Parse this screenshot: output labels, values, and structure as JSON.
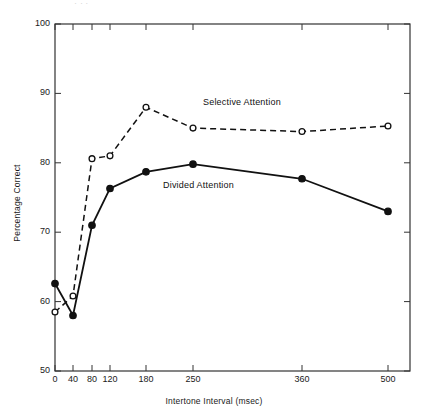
{
  "figure": {
    "top_fragment": "', ,',",
    "background_color": "#ffffff",
    "line_color": "#111111"
  },
  "chart_data": {
    "type": "line",
    "title": "",
    "xlabel": "Intertone Interval (msec)",
    "ylabel": "Percentage Correct",
    "categories": [
      "0",
      "40",
      "80",
      "120",
      "180",
      "250",
      "360",
      "500"
    ],
    "x": [
      0,
      40,
      80,
      120,
      180,
      250,
      360,
      500
    ],
    "xtick_labels": [
      "0",
      "40",
      "80",
      "120",
      "180",
      "250",
      "360",
      "500"
    ],
    "ytick_labels": [
      "50",
      "60",
      "70",
      "80",
      "90",
      "100"
    ],
    "yticks": [
      50,
      60,
      70,
      80,
      90,
      100
    ],
    "ylim": [
      50,
      100
    ],
    "x_scale": "ordinal",
    "grid": false,
    "legend": "inline-annotation",
    "series": [
      {
        "name": "Selective Attention",
        "values": [
          58.5,
          60.8,
          80.6,
          81.0,
          88.0,
          85.0,
          84.5,
          85.3
        ],
        "marker": "open-circle",
        "line_style": "dashed",
        "color": "#111111",
        "label_position": {
          "x": 203,
          "y": 97
        }
      },
      {
        "name": "Divided Attention",
        "values": [
          62.6,
          58.0,
          71.0,
          76.3,
          78.7,
          79.8,
          77.7,
          73.0
        ],
        "marker": "filled-circle",
        "line_style": "solid",
        "color": "#111111",
        "label_position": {
          "x": 163,
          "y": 180
        }
      }
    ],
    "annotations": [
      {
        "text": "Selective Attention",
        "series": "Selective Attention"
      },
      {
        "text": "Divided Attention",
        "series": "Divided Attention"
      }
    ]
  },
  "axes": {
    "left_px": 55,
    "right_px": 410,
    "top_px": 24,
    "bottom_px": 371,
    "x_positions_px": [
      55,
      73,
      92,
      110,
      146,
      193,
      302,
      388
    ]
  }
}
